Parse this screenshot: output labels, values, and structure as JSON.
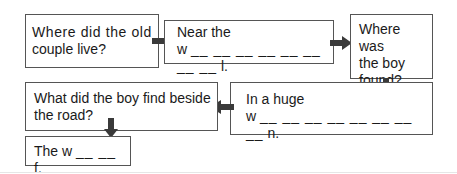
{
  "boxes": {
    "q1": {
      "line1": "Where did the old",
      "line2": "couple live?"
    },
    "a1": {
      "line1": "Near the",
      "start": "w",
      "blanks": "__ __ __ __ __ __ __ __",
      "end": "l."
    },
    "q2": {
      "line1": "Where was",
      "line2": "the boy",
      "line3": "found?"
    },
    "a2": {
      "line1": "In a huge",
      "start": "w",
      "blanks": "__ __ __ __ __ __ __ __",
      "end": "n."
    },
    "q3": {
      "line1": "What did the boy find beside",
      "line2": "the road?"
    },
    "a3": {
      "start": "The w",
      "blanks": "__ __",
      "end": "f."
    }
  },
  "colors": {
    "border": "#555555",
    "arrow": "#3a3a3a",
    "text": "#1a1a1a"
  }
}
